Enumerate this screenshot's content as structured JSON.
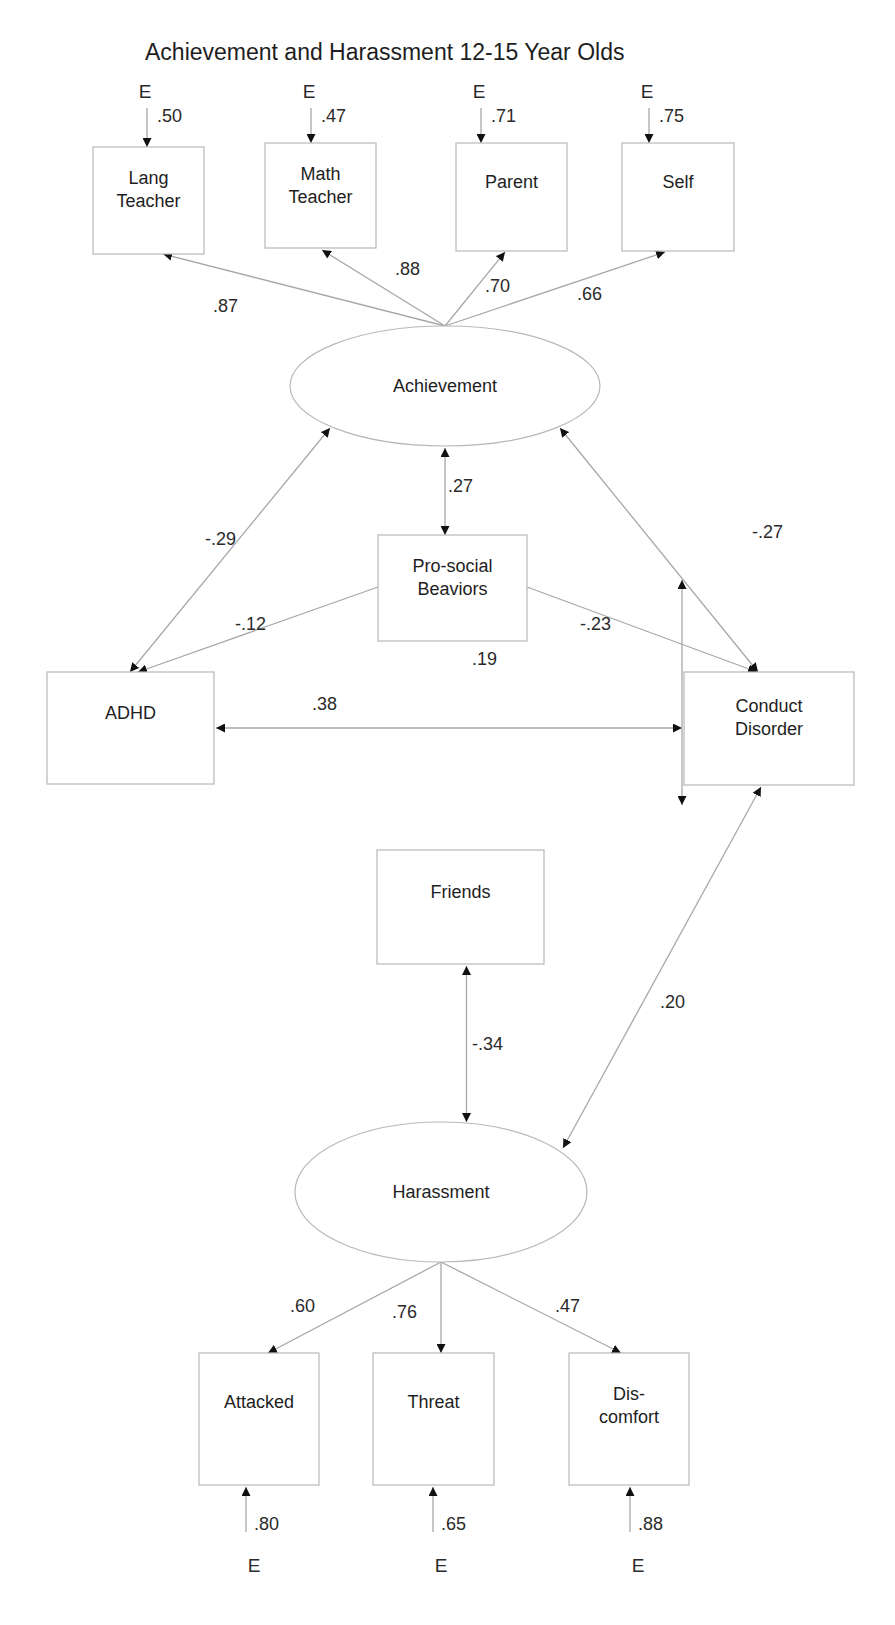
{
  "title": "Achievement and Harassment 12-15 Year Olds",
  "colors": {
    "line": "#a8a8a8",
    "box_border": "#b8b8b8",
    "text": "#1e1e1e",
    "arrowhead": "#111111"
  },
  "nodes": {
    "lang_teacher": {
      "lines": [
        "Lang",
        "Teacher"
      ],
      "shape": "rect",
      "x": 93,
      "y": 147,
      "w": 111,
      "h": 107
    },
    "math_teacher": {
      "lines": [
        "Math",
        "Teacher"
      ],
      "shape": "rect",
      "x": 265,
      "y": 143,
      "w": 111,
      "h": 105
    },
    "parent": {
      "lines": [
        "Parent"
      ],
      "shape": "rect",
      "x": 456,
      "y": 143,
      "w": 111,
      "h": 108
    },
    "self": {
      "lines": [
        "Self"
      ],
      "shape": "rect",
      "x": 622,
      "y": 143,
      "w": 112,
      "h": 108
    },
    "achievement": {
      "lines": [
        "Achievement"
      ],
      "shape": "ellipse",
      "cx": 445,
      "cy": 386,
      "rx": 155,
      "ry": 60
    },
    "prosocial": {
      "lines": [
        "Pro-social",
        "Beaviors"
      ],
      "shape": "rect",
      "x": 378,
      "y": 535,
      "w": 149,
      "h": 106
    },
    "adhd": {
      "lines": [
        "ADHD"
      ],
      "shape": "rect",
      "x": 47,
      "y": 672,
      "w": 167,
      "h": 112
    },
    "conduct": {
      "lines": [
        "Conduct",
        "Disorder"
      ],
      "shape": "rect",
      "x": 684,
      "y": 672,
      "w": 170,
      "h": 113
    },
    "friends": {
      "lines": [
        "Friends"
      ],
      "shape": "rect",
      "x": 377,
      "y": 850,
      "w": 167,
      "h": 114
    },
    "harassment": {
      "lines": [
        "Harassment"
      ],
      "shape": "ellipse",
      "cx": 441,
      "cy": 1192,
      "rx": 146,
      "ry": 70
    },
    "attacked": {
      "lines": [
        "Attacked"
      ],
      "shape": "rect",
      "x": 199,
      "y": 1353,
      "w": 120,
      "h": 132
    },
    "threat": {
      "lines": [
        "Threat"
      ],
      "shape": "rect",
      "x": 373,
      "y": 1353,
      "w": 121,
      "h": 132
    },
    "discomfort": {
      "lines": [
        "Dis-",
        "comfort"
      ],
      "shape": "rect",
      "x": 569,
      "y": 1353,
      "w": 120,
      "h": 132
    }
  },
  "errors_top": [
    {
      "indicator": "lang_teacher",
      "label": "E",
      "value": ".50",
      "x": 147
    },
    {
      "indicator": "math_teacher",
      "label": "E",
      "value": ".47",
      "x": 311
    },
    {
      "indicator": "parent",
      "label": "E",
      "value": ".71",
      "x": 481
    },
    {
      "indicator": "self",
      "label": "E",
      "value": ".75",
      "x": 649
    }
  ],
  "errors_bottom": [
    {
      "indicator": "attacked",
      "label": "E",
      "value": ".80",
      "x": 246
    },
    {
      "indicator": "threat",
      "label": "E",
      "value": ".65",
      "x": 433
    },
    {
      "indicator": "discomfort",
      "label": "E",
      "value": ".88",
      "x": 630
    }
  ],
  "loadings": {
    "lang_teacher": ".87",
    "math_teacher": ".88",
    "parent": ".70",
    "self": ".66",
    "attacked": ".60",
    "threat": ".76",
    "discomfort": ".47"
  },
  "paths": {
    "achievement_prosocial": ".27",
    "achievement_adhd": "-.29",
    "achievement_conduct": "-.27",
    "prosocial_adhd": "-.12",
    "prosocial_conduct": "-.23",
    "adhd_conduct": ".38",
    "conduct_vertical": ".19",
    "friends_harassment": "-.34",
    "conduct_harassment": ".20"
  },
  "chart_data": {
    "type": "path_diagram",
    "title": "Achievement and Harassment 12-15 Year Olds",
    "latent_factors": [
      "Achievement",
      "Harassment"
    ],
    "observed_variables": [
      "Lang Teacher",
      "Math Teacher",
      "Parent",
      "Self",
      "Pro-social Beaviors",
      "ADHD",
      "Conduct Disorder",
      "Friends",
      "Attacked",
      "Threat",
      "Dis-comfort"
    ],
    "factor_loadings": [
      {
        "factor": "Achievement",
        "indicator": "Lang Teacher",
        "value": 0.87,
        "error": 0.5
      },
      {
        "factor": "Achievement",
        "indicator": "Math Teacher",
        "value": 0.88,
        "error": 0.47
      },
      {
        "factor": "Achievement",
        "indicator": "Parent",
        "value": 0.7,
        "error": 0.71
      },
      {
        "factor": "Achievement",
        "indicator": "Self",
        "value": 0.66,
        "error": 0.75
      },
      {
        "factor": "Harassment",
        "indicator": "Attacked",
        "value": 0.6,
        "error": 0.8
      },
      {
        "factor": "Harassment",
        "indicator": "Threat",
        "value": 0.76,
        "error": 0.65
      },
      {
        "factor": "Harassment",
        "indicator": "Dis-comfort",
        "value": 0.47,
        "error": 0.88
      }
    ],
    "correlations": [
      {
        "from": "Achievement",
        "to": "Pro-social Beaviors",
        "value": 0.27
      },
      {
        "from": "Achievement",
        "to": "ADHD",
        "value": -0.29
      },
      {
        "from": "Achievement",
        "to": "Conduct Disorder",
        "value": -0.27
      },
      {
        "from": "Pro-social Beaviors",
        "to": "ADHD",
        "value": -0.12
      },
      {
        "from": "Pro-social Beaviors",
        "to": "Conduct Disorder",
        "value": -0.23
      },
      {
        "from": "ADHD",
        "to": "Conduct Disorder",
        "value": 0.38
      },
      {
        "from": "Conduct Disorder (vertical)",
        "to": "Conduct Disorder",
        "value": 0.19
      },
      {
        "from": "Friends",
        "to": "Harassment",
        "value": -0.34
      },
      {
        "from": "Conduct Disorder",
        "to": "Harassment",
        "value": 0.2
      }
    ]
  }
}
